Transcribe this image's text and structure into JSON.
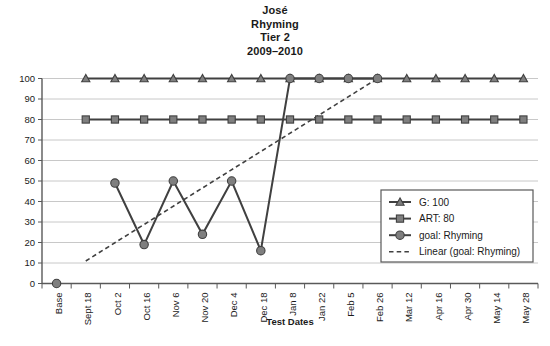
{
  "chart_data": {
    "type": "line",
    "title": "José\nRhyming\nTier 2\n2009–2010",
    "title_lines": [
      "José",
      "Rhyming",
      "Tier 2",
      "2009–2010"
    ],
    "xlabel": "Test Dates",
    "ylabel": "",
    "ylim": [
      0,
      100
    ],
    "ytick_step": 10,
    "grid": true,
    "legend_position": "lower right",
    "categories": [
      "Base",
      "Sept 18",
      "Oct 2",
      "Oct 16",
      "Nov 6",
      "Nov 20",
      "Dec 4",
      "Dec 18",
      "Jan 8",
      "Jan 22",
      "Feb 5",
      "Feb 26",
      "Mar 12",
      "Apr 16",
      "Apr 30",
      "May 14",
      "May 28"
    ],
    "yticks": [
      0,
      10,
      20,
      30,
      40,
      50,
      60,
      70,
      80,
      90,
      100
    ],
    "series": [
      {
        "name": "G: 100",
        "marker": "triangle",
        "style": "solid",
        "color": "#595959",
        "values": [
          null,
          100,
          100,
          100,
          100,
          100,
          100,
          100,
          100,
          100,
          100,
          100,
          100,
          100,
          100,
          100,
          100
        ]
      },
      {
        "name": "ART: 80",
        "marker": "square",
        "style": "solid",
        "color": "#595959",
        "values": [
          null,
          80,
          80,
          80,
          80,
          80,
          80,
          80,
          80,
          80,
          80,
          80,
          80,
          80,
          80,
          80,
          80
        ]
      },
      {
        "name": "goal: Rhyming",
        "marker": "circle",
        "style": "solid",
        "color": "#595959",
        "values": [
          0,
          null,
          49,
          19,
          50,
          24,
          50,
          16,
          100,
          100,
          100,
          100,
          null,
          null,
          null,
          null,
          null
        ]
      },
      {
        "name": "Linear (goal: Rhyming)",
        "marker": "none",
        "style": "dashed",
        "color": "#1a1a1a",
        "trend_from": {
          "x_index": 1,
          "value": 11
        },
        "trend_to": {
          "x_index": 11,
          "value": 100
        }
      }
    ]
  },
  "legend": {
    "entries": [
      {
        "label": "G: 100",
        "marker": "triangle"
      },
      {
        "label": "ART: 80",
        "marker": "square"
      },
      {
        "label": "goal: Rhyming",
        "marker": "circle"
      },
      {
        "label": "Linear (goal: Rhyming)",
        "marker": "dashed-line"
      }
    ]
  },
  "colors": {
    "series_marker": "#7f7f7f",
    "series_line": "#404040",
    "grid": "#c8c8c8",
    "axis": "#595959",
    "text": "#1a1a1a",
    "background": "#ffffff"
  }
}
